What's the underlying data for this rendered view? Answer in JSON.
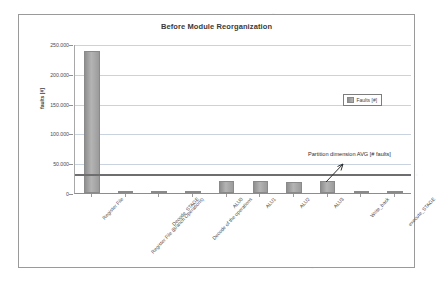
{
  "chart_data": {
    "type": "bar",
    "title": "Before Module Reorganization",
    "xlabel": "",
    "ylabel": "faults [#]",
    "ylim": [
      0,
      250000
    ],
    "ytick_labels": [
      "250.000",
      "200.000",
      "150.000",
      "100.000",
      "50.000",
      "0"
    ],
    "ytick_values": [
      250000,
      200000,
      150000,
      100000,
      50000,
      0
    ],
    "grid": true,
    "legend_position": "right",
    "legend": [
      "Faults [#]"
    ],
    "categories": [
      "Register File",
      "Register File (Branch Operations)",
      "Decode_STAGE",
      "Decode of the operations",
      "ALU0",
      "ALU1",
      "ALU2",
      "ALU3",
      "Write_back",
      "execute_STAGE"
    ],
    "series": [
      {
        "name": "Faults [#]",
        "values": [
          239000,
          400,
          1500,
          2600,
          20000,
          19500,
          19000,
          19500,
          300,
          600
        ]
      }
    ],
    "annotations": [
      {
        "text": "Partition dimension AVG [# faults]",
        "value": 33000,
        "type": "horizontal-line-with-arrow"
      }
    ]
  },
  "colors": {
    "bar_fill": "#a8a8a8",
    "bar_edge": "#8a8a8a",
    "avg_line": "#6e6e6e",
    "gridline": "#c9d3dd",
    "frame": "#9a9a9a",
    "text": "#3f3f3f"
  }
}
